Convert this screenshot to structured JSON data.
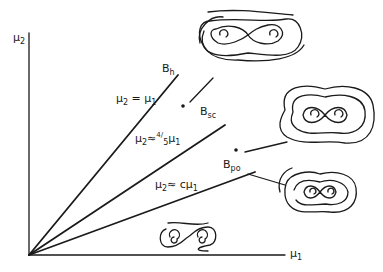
{
  "figure": {
    "axes": {
      "x_label": "μ",
      "x_label_sub": "1",
      "y_label": "μ",
      "y_label_sub": "2"
    },
    "curves": [
      {
        "name": "B_h",
        "label": "B",
        "label_sub": "h",
        "equation": "μ2 = μ1",
        "eq_parts": [
          "μ",
          "2",
          " = μ",
          "1"
        ]
      },
      {
        "name": "B_sc",
        "label": "B",
        "label_sub": "sc",
        "equation": "μ2 ≈ 4/5 μ1",
        "eq_parts": [
          "μ",
          "2",
          "≈",
          "4/",
          "5",
          "μ",
          "1"
        ]
      },
      {
        "name": "B_po",
        "label": "B",
        "label_sub": "po",
        "equation": "μ2 ≈ c μ1",
        "eq_parts": [
          "μ",
          "2",
          "≈ cμ",
          "1"
        ]
      }
    ],
    "phase_portraits": [
      {
        "region": "above B_h",
        "description": "two spiral foci with homoclinic figure-eight and outer orbits"
      },
      {
        "region": "between B_h and B_sc",
        "description": "nested periodic orbits surrounding figure-eight"
      },
      {
        "region": "between B_sc and B_po",
        "description": "figure-eight with surrounding closed orbits"
      },
      {
        "region": "below B_po",
        "description": "two spiral foci with figure-eight, no outer orbit"
      }
    ]
  }
}
